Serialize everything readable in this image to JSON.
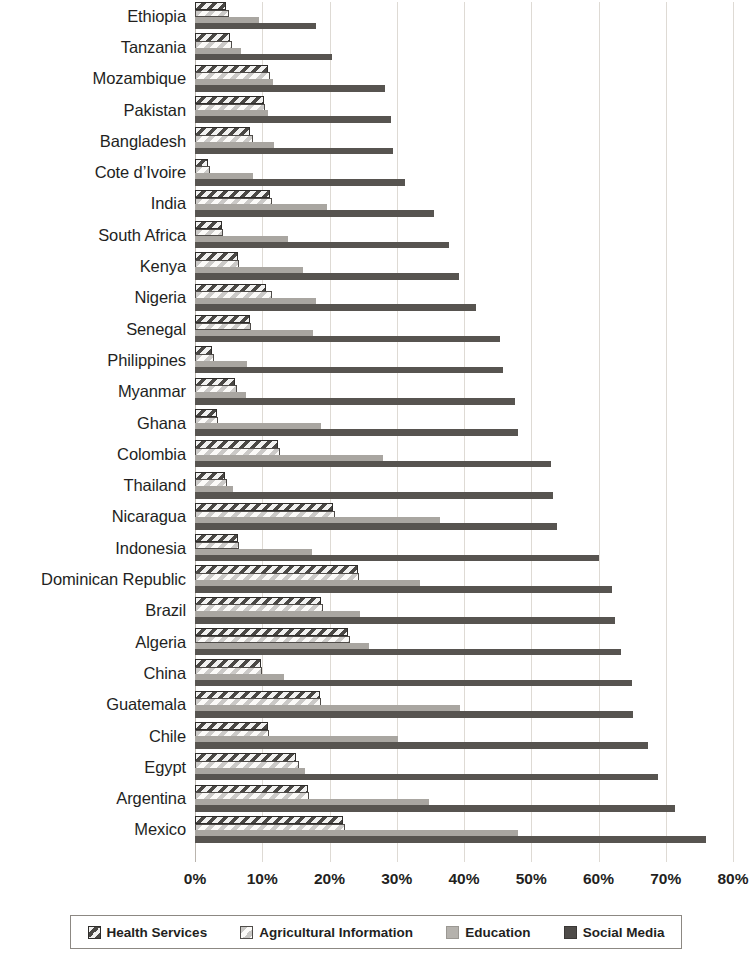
{
  "chart_data": {
    "type": "bar",
    "orientation": "horizontal",
    "title": "",
    "xlabel": "",
    "ylabel": "",
    "xlim": [
      0,
      80
    ],
    "xtick_labels": [
      "0%",
      "10%",
      "20%",
      "30%",
      "40%",
      "50%",
      "60%",
      "70%",
      "80%"
    ],
    "xticks": [
      0,
      10,
      20,
      30,
      40,
      50,
      60,
      70,
      80
    ],
    "grid": true,
    "legend_position": "bottom",
    "value_unit": "%",
    "categories": [
      "Ethiopia",
      "Tanzania",
      "Mozambique",
      "Pakistan",
      "Bangladesh",
      "Cote d’Ivoire",
      "India",
      "South Africa",
      "Kenya",
      "Nigeria",
      "Senegal",
      "Philippines",
      "Myanmar",
      "Ghana",
      "Colombia",
      "Thailand",
      "Nicaragua",
      "Indonesia",
      "Dominican Republic",
      "Brazil",
      "Algeria",
      "China",
      "Guatemala",
      "Chile",
      "Egypt",
      "Argentina",
      "Mexico"
    ],
    "series": [
      {
        "name": "Health Services",
        "color": "#4a4845",
        "pattern": "dark-hatch",
        "values": [
          4.6,
          5.2,
          10.8,
          10.2,
          8.2,
          2.0,
          11.2,
          4.0,
          6.4,
          10.5,
          8.2,
          2.6,
          6.0,
          3.2,
          12.4,
          4.5,
          20.5,
          6.4,
          24.2,
          18.8,
          22.8,
          9.8,
          18.6,
          10.8,
          15.0,
          16.8,
          22.0
        ]
      },
      {
        "name": "Agricultural Information",
        "color": "#fbfaf8",
        "pattern": "light-hatch",
        "values": [
          5.0,
          5.5,
          11.2,
          10.4,
          8.6,
          2.2,
          11.4,
          4.2,
          6.6,
          11.5,
          8.4,
          2.8,
          6.2,
          3.4,
          12.6,
          4.8,
          20.8,
          6.6,
          24.4,
          19.0,
          23.0,
          10.0,
          18.8,
          11.0,
          15.4,
          17.0,
          22.3
        ]
      },
      {
        "name": "Education",
        "color": "#a9a6a1",
        "pattern": "solid",
        "values": [
          9.5,
          6.8,
          11.6,
          10.8,
          11.8,
          8.6,
          19.6,
          13.8,
          16.0,
          18.0,
          17.5,
          7.8,
          7.6,
          18.8,
          28.0,
          5.6,
          36.4,
          17.4,
          33.4,
          24.6,
          25.8,
          13.2,
          39.4,
          30.2,
          16.4,
          34.8,
          48.0
        ]
      },
      {
        "name": "Social Media",
        "color": "#575450",
        "pattern": "solid",
        "values": [
          18.0,
          20.4,
          28.2,
          29.2,
          29.4,
          31.2,
          35.6,
          37.8,
          39.2,
          41.8,
          45.4,
          45.8,
          47.6,
          48.0,
          53.0,
          53.2,
          53.8,
          60.0,
          62.0,
          62.4,
          63.4,
          65.0,
          65.2,
          67.4,
          68.8,
          71.4,
          76.0
        ]
      }
    ]
  },
  "legend": {
    "items": [
      {
        "label": "Health Services",
        "swatch": "health"
      },
      {
        "label": "Agricultural Information",
        "swatch": "agri"
      },
      {
        "label": "Education",
        "swatch": "education"
      },
      {
        "label": "Social Media",
        "swatch": "social"
      }
    ]
  }
}
